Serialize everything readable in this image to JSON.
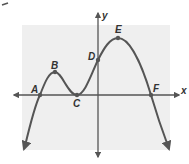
{
  "diagram": {
    "type": "polynomial-function-graph",
    "axes": {
      "x_label": "x",
      "y_label": "y"
    },
    "points": [
      {
        "label": "A",
        "description": "x-intercept",
        "px": 40,
        "py": 95
      },
      {
        "label": "B",
        "description": "local maximum",
        "px": 55,
        "py": 72
      },
      {
        "label": "C",
        "description": "local minimum / x-intercept (touches axis)",
        "px": 77,
        "py": 95
      },
      {
        "label": "D",
        "description": "y-intercept",
        "px": 98,
        "py": 60
      },
      {
        "label": "E",
        "description": "local maximum",
        "px": 118,
        "py": 38
      },
      {
        "label": "F",
        "description": "x-intercept",
        "px": 151,
        "py": 95
      }
    ],
    "colors": {
      "grid_background": "#efefef",
      "curve": "#555555",
      "axis": "#555555",
      "point": "#555555"
    }
  }
}
